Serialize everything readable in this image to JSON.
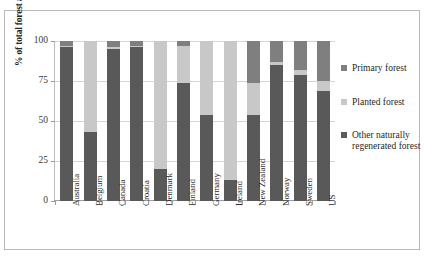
{
  "chart_data": {
    "type": "bar",
    "subtype": "stacked-bar-100",
    "title": "",
    "xlabel": "",
    "ylabel": "% of total forest area",
    "ylim": [
      0,
      100
    ],
    "yticks": [
      0,
      25,
      50,
      75,
      100
    ],
    "grid": true,
    "legend_position": "right",
    "categories": [
      "Australia",
      "Belgium",
      "Canada",
      "Croatia",
      "Denmark",
      "Finland",
      "Germany",
      "Ireland",
      "New Zealand",
      "Norway",
      "Sweden",
      "US"
    ],
    "series": [
      {
        "name": "Other naturally regenerated forest",
        "color": "#595959",
        "values": [
          96,
          43,
          95,
          96,
          20,
          74,
          54,
          13,
          54,
          85,
          79,
          69
        ]
      },
      {
        "name": "Planted forest",
        "color": "#c9c8c8",
        "values": [
          1,
          57,
          1,
          1,
          80,
          23,
          46,
          87,
          20,
          2,
          3,
          6
        ]
      },
      {
        "name": "Primary forest",
        "color": "#807f7f",
        "values": [
          3,
          0,
          4,
          3,
          0,
          3,
          0,
          0,
          26,
          13,
          18,
          25
        ]
      }
    ]
  },
  "legend": {
    "items": [
      {
        "label": "Primary forest",
        "color": "#807f7f"
      },
      {
        "label": "Planted forest",
        "color": "#c9c8c8"
      },
      {
        "label": "Other naturally regenerated forest",
        "color": "#595959"
      }
    ]
  }
}
